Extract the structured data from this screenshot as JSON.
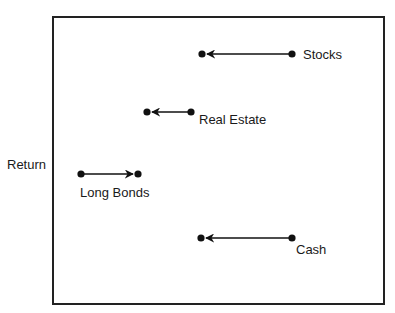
{
  "axis": {
    "ylabel": "Return"
  },
  "items": [
    {
      "label": "Stocks",
      "from_x": 292,
      "to_x": 202,
      "y": 54,
      "direction": "left"
    },
    {
      "label": "Real Estate",
      "from_x": 191,
      "to_x": 147,
      "y": 112,
      "direction": "left"
    },
    {
      "label": "Long Bonds",
      "from_x": 81,
      "to_x": 138,
      "y": 174,
      "direction": "right"
    },
    {
      "label": "Cash",
      "from_x": 292,
      "to_x": 201,
      "y": 238,
      "direction": "left"
    }
  ]
}
